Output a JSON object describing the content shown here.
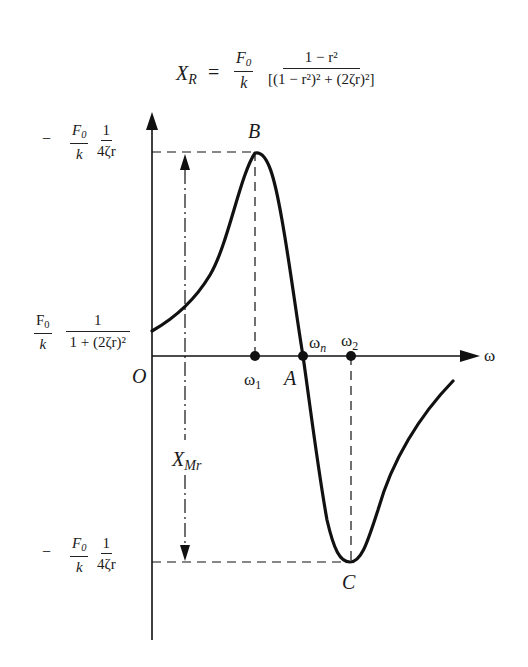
{
  "figure": {
    "title_formula": {
      "lhs": "X",
      "lhs_sub": "R",
      "equals": "=",
      "frac1_num": "F",
      "frac1_num_sub": "0",
      "frac1_den": "k",
      "frac2_num": "1 − r²",
      "frac2_den": "[(1 − r²)² + (2ζr)²]"
    },
    "axes": {
      "x_label": "ω",
      "origin_label": "O"
    },
    "points": {
      "B": "B",
      "A": "A",
      "C": "C"
    },
    "x_ticks": {
      "omega1": "ω",
      "omega1_sub": "1",
      "omegan": "ω",
      "omegan_sub": "n",
      "omega2": "ω",
      "omega2_sub": "2"
    },
    "y_labels": {
      "top": {
        "sign": "−",
        "f_num": "F",
        "f_num_sub": "0",
        "f_den": "k",
        "g_num": "1",
        "g_den": "4ζr"
      },
      "intercept": {
        "f_num": "F",
        "f_num_sub": "0",
        "f_den": "k",
        "g_num": "1",
        "g_den": "1 + (2ζr)²"
      },
      "bottom": {
        "sign": "−",
        "f_num": "F",
        "f_num_sub": "0",
        "f_den": "k",
        "g_num": "1",
        "g_den": "4ζr"
      }
    },
    "span_label": {
      "main": "X",
      "sub": "Mr"
    },
    "colors": {
      "ink": "#111111",
      "background": "#ffffff"
    }
  }
}
